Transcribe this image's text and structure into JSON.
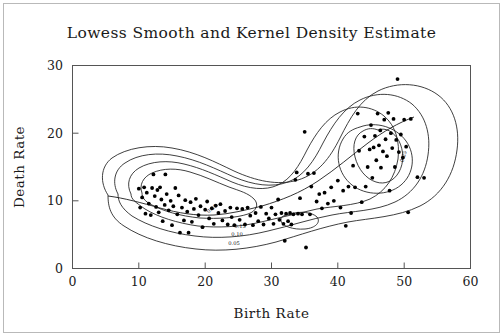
{
  "figure": {
    "title": "Lowess Smooth and Kernel Density Estimate",
    "background_color": "#ffffff",
    "ink_color": "#1a1a1a",
    "border_color": "#b9b9b9"
  },
  "chart_data": {
    "type": "scatter",
    "title": "Lowess Smooth and Kernel Density Estimate",
    "xlabel": "Birth Rate",
    "ylabel": "Death Rate",
    "xlim": [
      0,
      60
    ],
    "ylim": [
      0,
      30
    ],
    "xticks": [
      0,
      10,
      20,
      30,
      40,
      50,
      60
    ],
    "yticks": [
      0,
      10,
      20,
      30
    ],
    "xtick_labels": [
      "0",
      "10",
      "20",
      "30",
      "40",
      "50",
      "60"
    ],
    "ytick_labels": [
      "0",
      "10",
      "20",
      "30"
    ],
    "grid": false,
    "legend": "none",
    "marker": "filled-circle",
    "marker_color": "#000000",
    "overlays": [
      "lowess-smooth",
      "kernel-density-contours"
    ],
    "contour_levels": [
      0.05,
      0.1,
      0.15,
      0.2
    ],
    "contour_labels": [
      "0.05",
      "0.10",
      "0.15",
      "0.20"
    ],
    "n_points": 141,
    "points": [
      [
        10.0,
        11.8
      ],
      [
        10.2,
        9.0
      ],
      [
        10.5,
        10.5
      ],
      [
        10.8,
        12.0
      ],
      [
        11.0,
        8.1
      ],
      [
        11.2,
        11.2
      ],
      [
        11.5,
        9.6
      ],
      [
        11.8,
        7.9
      ],
      [
        12.0,
        11.9
      ],
      [
        12.2,
        13.9
      ],
      [
        12.4,
        10.7
      ],
      [
        12.6,
        9.1
      ],
      [
        12.8,
        11.6
      ],
      [
        13.0,
        8.3
      ],
      [
        13.2,
        12.0
      ],
      [
        13.4,
        10.2
      ],
      [
        13.6,
        7.0
      ],
      [
        13.9,
        9.4
      ],
      [
        14.0,
        13.9
      ],
      [
        14.2,
        11.0
      ],
      [
        14.5,
        8.6
      ],
      [
        14.8,
        10.0
      ],
      [
        15.0,
        6.4
      ],
      [
        15.2,
        9.2
      ],
      [
        15.5,
        11.9
      ],
      [
        15.8,
        8.0
      ],
      [
        16.0,
        10.8
      ],
      [
        16.2,
        5.3
      ],
      [
        16.5,
        9.0
      ],
      [
        16.8,
        7.1
      ],
      [
        17.0,
        10.1
      ],
      [
        17.3,
        8.4
      ],
      [
        17.5,
        5.3
      ],
      [
        17.8,
        9.8
      ],
      [
        18.0,
        6.9
      ],
      [
        18.3,
        8.8
      ],
      [
        18.6,
        10.3
      ],
      [
        19.0,
        7.9
      ],
      [
        19.3,
        9.2
      ],
      [
        19.6,
        6.1
      ],
      [
        20.0,
        8.7
      ],
      [
        20.3,
        9.9
      ],
      [
        20.6,
        7.4
      ],
      [
        21.0,
        8.9
      ],
      [
        21.3,
        6.6
      ],
      [
        21.6,
        9.3
      ],
      [
        22.0,
        8.2
      ],
      [
        22.3,
        9.5
      ],
      [
        22.6,
        7.1
      ],
      [
        23.0,
        8.5
      ],
      [
        23.4,
        6.5
      ],
      [
        23.8,
        9.0
      ],
      [
        24.0,
        7.6
      ],
      [
        24.4,
        6.4
      ],
      [
        24.8,
        8.9
      ],
      [
        25.2,
        7.2
      ],
      [
        25.6,
        8.8
      ],
      [
        26.0,
        6.5
      ],
      [
        26.4,
        9.0
      ],
      [
        26.8,
        7.8
      ],
      [
        27.2,
        6.4
      ],
      [
        27.6,
        8.2
      ],
      [
        28.0,
        7.0
      ],
      [
        28.4,
        9.1
      ],
      [
        28.8,
        6.5
      ],
      [
        29.2,
        8.1
      ],
      [
        29.6,
        7.4
      ],
      [
        30.0,
        9.0
      ],
      [
        30.3,
        6.6
      ],
      [
        30.6,
        8.0
      ],
      [
        31.0,
        10.2
      ],
      [
        31.2,
        7.2
      ],
      [
        31.5,
        8.2
      ],
      [
        31.8,
        6.6
      ],
      [
        32.0,
        4.1
      ],
      [
        32.2,
        8.1
      ],
      [
        32.5,
        7.0
      ],
      [
        32.8,
        8.2
      ],
      [
        33.0,
        6.5
      ],
      [
        33.3,
        8.0
      ],
      [
        33.6,
        13.1
      ],
      [
        33.8,
        14.2
      ],
      [
        34.0,
        8.1
      ],
      [
        34.3,
        10.4
      ],
      [
        34.6,
        8.0
      ],
      [
        35.0,
        20.2
      ],
      [
        35.2,
        3.1
      ],
      [
        35.5,
        14.0
      ],
      [
        35.8,
        8.0
      ],
      [
        36.0,
        12.1
      ],
      [
        36.4,
        14.1
      ],
      [
        36.8,
        9.9
      ],
      [
        37.2,
        11.0
      ],
      [
        37.6,
        8.9
      ],
      [
        38.0,
        11.2
      ],
      [
        38.5,
        9.6
      ],
      [
        39.0,
        12.0
      ],
      [
        39.4,
        10.0
      ],
      [
        40.0,
        13.0
      ],
      [
        40.4,
        9.0
      ],
      [
        40.8,
        11.5
      ],
      [
        41.2,
        6.3
      ],
      [
        41.6,
        12.1
      ],
      [
        42.0,
        8.2
      ],
      [
        42.3,
        15.2
      ],
      [
        42.6,
        12.0
      ],
      [
        43.0,
        22.9
      ],
      [
        43.2,
        17.4
      ],
      [
        43.6,
        9.8
      ],
      [
        44.0,
        19.5
      ],
      [
        44.2,
        12.1
      ],
      [
        44.5,
        15.0
      ],
      [
        44.8,
        17.6
      ],
      [
        45.0,
        21.2
      ],
      [
        45.2,
        13.4
      ],
      [
        45.4,
        17.9
      ],
      [
        45.6,
        19.6
      ],
      [
        45.8,
        16.0
      ],
      [
        46.0,
        22.9
      ],
      [
        46.2,
        18.2
      ],
      [
        46.4,
        20.4
      ],
      [
        46.5,
        14.9
      ],
      [
        46.8,
        17.3
      ],
      [
        47.0,
        22.0
      ],
      [
        47.2,
        19.1
      ],
      [
        47.4,
        16.6
      ],
      [
        47.6,
        23.0
      ],
      [
        47.8,
        11.5
      ],
      [
        48.0,
        20.0
      ],
      [
        48.2,
        17.8
      ],
      [
        48.4,
        22.1
      ],
      [
        48.6,
        15.0
      ],
      [
        48.8,
        19.0
      ],
      [
        49.0,
        28.0
      ],
      [
        49.2,
        17.2
      ],
      [
        49.5,
        19.8
      ],
      [
        49.8,
        16.4
      ],
      [
        50.0,
        22.0
      ],
      [
        50.3,
        18.0
      ],
      [
        50.6,
        8.3
      ],
      [
        51.0,
        22.1
      ],
      [
        52.0,
        13.5
      ],
      [
        53.0,
        13.4
      ]
    ]
  },
  "axes": {
    "x_tick_labels": [
      "0",
      "10",
      "20",
      "30",
      "40",
      "50",
      "60"
    ],
    "y_tick_labels": [
      "0",
      "10",
      "20",
      "30"
    ],
    "x_axis_title": "Birth Rate",
    "y_axis_title": "Death Rate"
  },
  "contour_annotations": [
    {
      "label": "0.05",
      "x": 234,
      "y": 243
    },
    {
      "label": "0.10",
      "x": 237,
      "y": 234
    },
    {
      "label": "0.15",
      "x": 240,
      "y": 226
    },
    {
      "label": "0.20",
      "x": 213,
      "y": 209
    },
    {
      "label": "0.25",
      "x": 405,
      "y": 156
    }
  ]
}
